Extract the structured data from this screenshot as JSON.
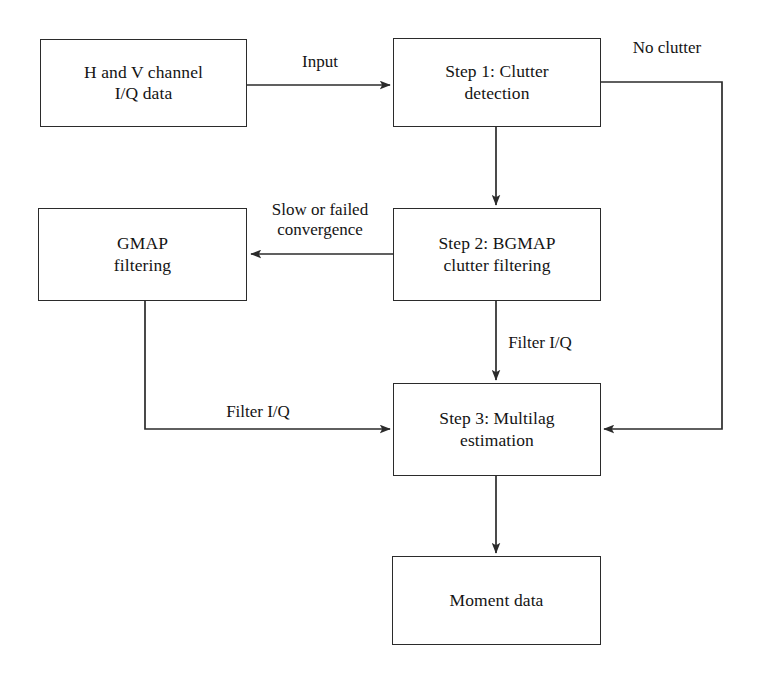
{
  "diagram": {
    "background_color": "#ffffff",
    "line_color": "#2b2b2b",
    "text_color": "#141414",
    "nodes": [
      {
        "id": "input-data",
        "label": "H and V channel\nI/Q data",
        "x": 40,
        "y": 39,
        "w": 207,
        "h": 88
      },
      {
        "id": "step1",
        "label": "Step 1: Clutter\ndetection",
        "x": 393,
        "y": 38,
        "w": 208,
        "h": 89
      },
      {
        "id": "gmap",
        "label": "GMAP\nfiltering",
        "x": 38,
        "y": 208,
        "w": 209,
        "h": 93
      },
      {
        "id": "step2",
        "label": "Step 2: BGMAP\nclutter filtering",
        "x": 393,
        "y": 208,
        "w": 208,
        "h": 93
      },
      {
        "id": "step3",
        "label": "Step 3: Multilag\nestimation",
        "x": 393,
        "y": 383,
        "w": 208,
        "h": 93
      },
      {
        "id": "moment",
        "label": "Moment data",
        "x": 392,
        "y": 556,
        "w": 209,
        "h": 89
      }
    ],
    "edges": [
      {
        "id": "input-to-step1",
        "label": "Input",
        "from": "input-data",
        "to": "step1",
        "label_x": 320,
        "label_y": 52
      },
      {
        "id": "step1-no-clutter-to-step3",
        "label": "No clutter",
        "from": "step1",
        "to": "step3",
        "label_x": 667,
        "label_y": 38
      },
      {
        "id": "step1-to-step2",
        "label": "",
        "from": "step1",
        "to": "step2",
        "label_x": 0,
        "label_y": 0
      },
      {
        "id": "step2-to-gmap",
        "label": "Slow or failed\nconvergence",
        "from": "step2",
        "to": "gmap",
        "label_x": 320,
        "label_y": 200
      },
      {
        "id": "step2-to-step3",
        "label": "Filter I/Q",
        "from": "step2",
        "to": "step3",
        "label_x": 540,
        "label_y": 333
      },
      {
        "id": "gmap-to-step3",
        "label": "Filter I/Q",
        "from": "gmap",
        "to": "step3",
        "label_x": 258,
        "label_y": 402
      },
      {
        "id": "step3-to-moment",
        "label": "",
        "from": "step3",
        "to": "moment",
        "label_x": 0,
        "label_y": 0
      }
    ]
  }
}
